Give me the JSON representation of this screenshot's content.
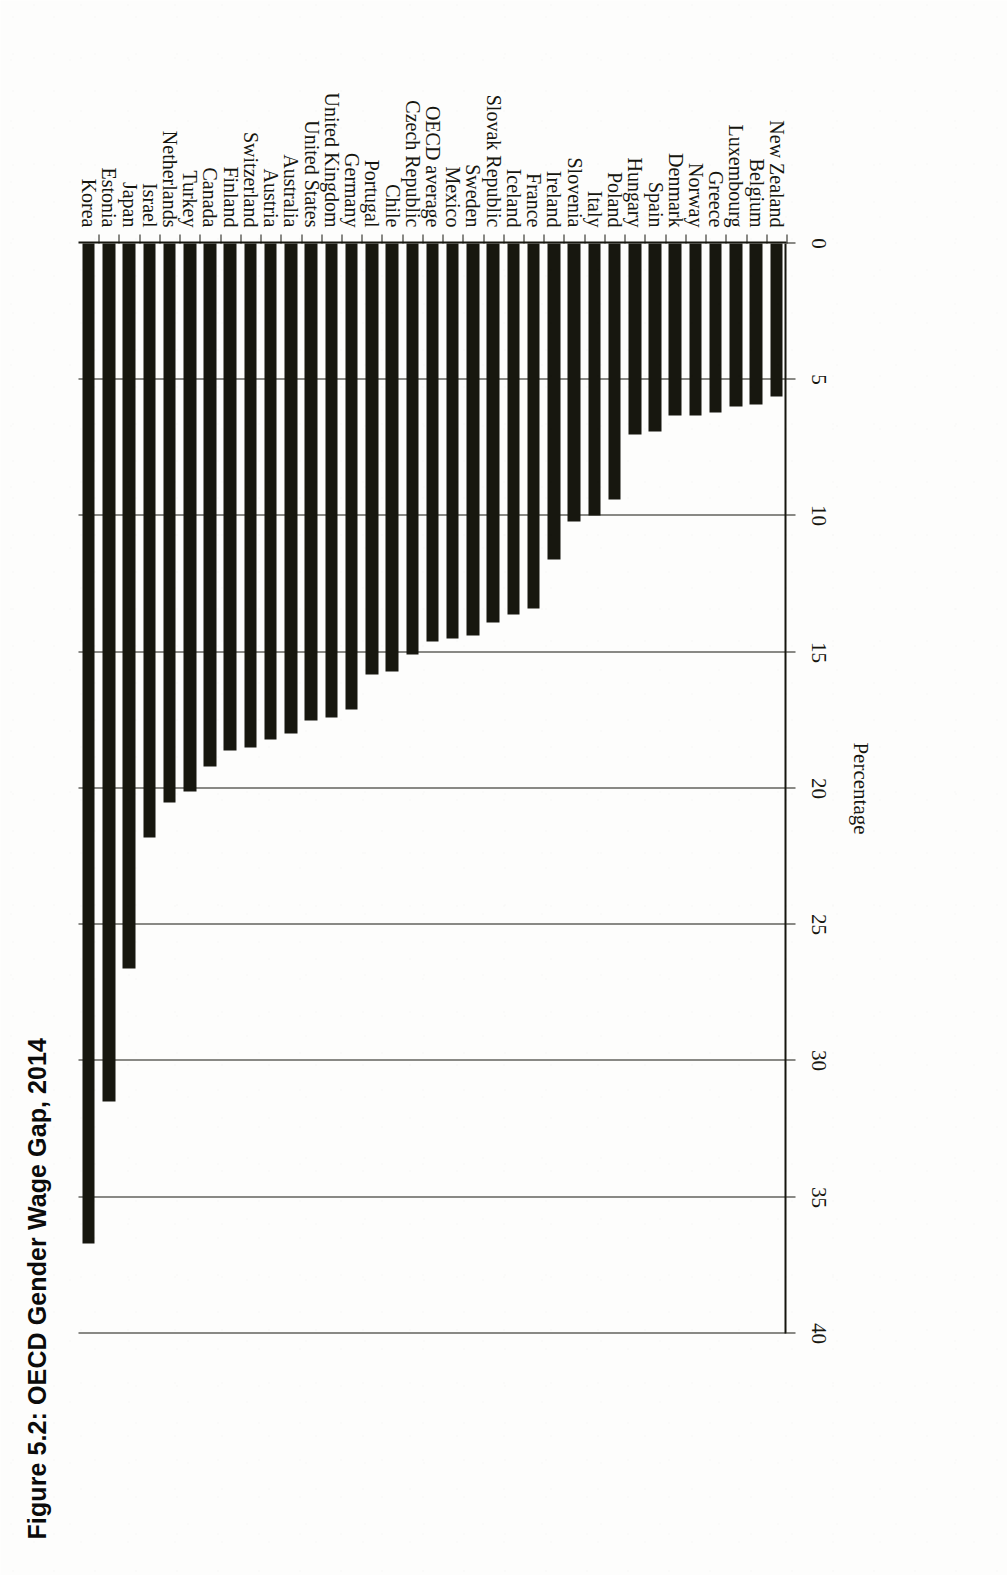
{
  "figure": {
    "title": "Figure 5.2: OECD Gender Wage Gap, 2014"
  },
  "colors": {
    "bar": "#17170f",
    "axis": "#16160f",
    "page": "#fdfdfc"
  },
  "axis": {
    "value_axis_title": "Percentage",
    "tick_labels": [
      "0",
      "5",
      "10",
      "15",
      "20",
      "25",
      "30",
      "35",
      "40"
    ]
  },
  "chart_data": {
    "type": "bar",
    "orientation": "horizontal",
    "title": "Figure 5.2: OECD Gender Wage Gap, 2014",
    "xlabel": "Percentage",
    "ylabel": "",
    "ylim": [
      0,
      40
    ],
    "grid": true,
    "legend": "none",
    "categories": [
      "Korea",
      "Estonia",
      "Japan",
      "Israel",
      "Netherlands",
      "Turkey",
      "Canada",
      "Finland",
      "Switzerland",
      "Austria",
      "Australia",
      "United States",
      "United Kingdom",
      "Germany",
      "Portugal",
      "Chile",
      "Czech Republic",
      "OECD average",
      "Mexico",
      "Sweden",
      "Slovak Republic",
      "Iceland",
      "France",
      "Ireland",
      "Slovenia",
      "Italy",
      "Poland",
      "Hungary",
      "Spain",
      "Denmark",
      "Norway",
      "Greece",
      "Luxembourg",
      "Belgium",
      "New Zealand"
    ],
    "values": [
      36.7,
      31.5,
      26.6,
      21.8,
      20.5,
      20.1,
      19.2,
      18.6,
      18.5,
      18.2,
      18.0,
      17.5,
      17.4,
      17.1,
      15.8,
      15.7,
      15.1,
      14.6,
      14.5,
      14.4,
      13.9,
      13.6,
      13.4,
      11.6,
      10.2,
      10.0,
      9.4,
      7.0,
      6.9,
      6.3,
      6.3,
      6.2,
      6.0,
      5.9,
      5.6
    ]
  }
}
